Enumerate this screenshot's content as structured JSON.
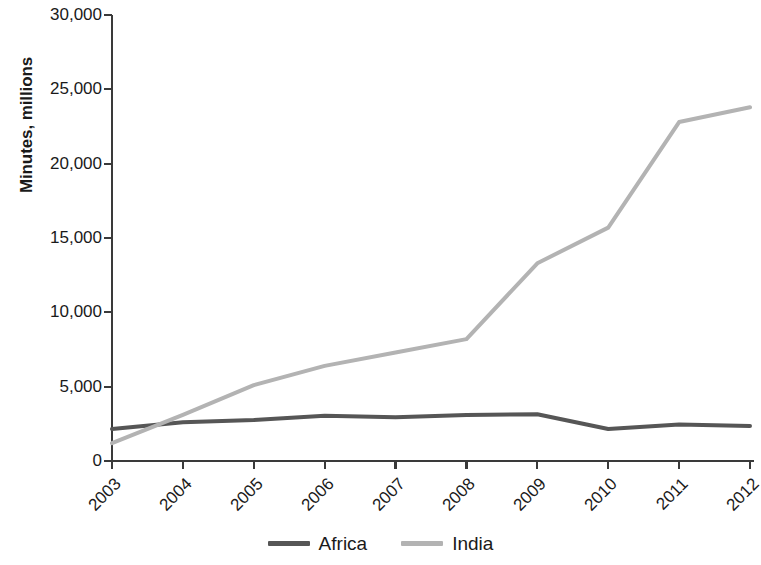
{
  "chart_data": {
    "type": "line",
    "title": "",
    "xlabel": "",
    "ylabel": "Minutes, millions",
    "categories": [
      "2003",
      "2004",
      "2005",
      "2006",
      "2007",
      "2008",
      "2009",
      "2010",
      "2011",
      "2012"
    ],
    "x": [
      2003,
      2004,
      2005,
      2006,
      2007,
      2008,
      2009,
      2010,
      2011,
      2012
    ],
    "series": [
      {
        "name": "Africa",
        "color": "#565656",
        "values": [
          2150,
          2600,
          2750,
          3050,
          2950,
          3100,
          3150,
          2150,
          2450,
          2350
        ]
      },
      {
        "name": "India",
        "color": "#b3b3b3",
        "values": [
          1200,
          3100,
          5100,
          6400,
          7300,
          8200,
          13300,
          15700,
          22800,
          23800
        ]
      }
    ],
    "ylim": [
      0,
      30000
    ],
    "yticks": [
      0,
      5000,
      10000,
      15000,
      20000,
      25000,
      30000
    ],
    "ytick_labels": [
      "0",
      "5,000",
      "10,000",
      "15,000",
      "20,000",
      "25,000",
      "30,000"
    ],
    "grid": false,
    "legend_position": "bottom",
    "axis_color": "#3a3a3a"
  },
  "legend": {
    "items": [
      {
        "label": "Africa",
        "color": "#565656"
      },
      {
        "label": "India",
        "color": "#b3b3b3"
      }
    ]
  }
}
